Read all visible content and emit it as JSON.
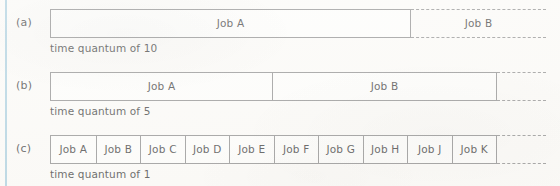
{
  "figure": {
    "kind": "gantt-timeline-round-robin",
    "left_rule_color": "#a9cede",
    "line_color": "#8c8c8c",
    "background_color": "#fbfaf7",
    "rows": [
      {
        "label": "(a)",
        "caption": "time quantum of 10",
        "segments": [
          {
            "name": "Job A",
            "style": "solid"
          }
        ],
        "tail": {
          "name": "Job B",
          "style": "dashed"
        }
      },
      {
        "label": "(b)",
        "caption": "time quantum of 5",
        "segments": [
          {
            "name": "Job A",
            "style": "solid"
          },
          {
            "name": "Job B",
            "style": "solid"
          }
        ],
        "tail": {
          "name": "",
          "style": "dashed"
        }
      },
      {
        "label": "(c)",
        "caption": "time quantum of 1",
        "segments": [
          {
            "name": "Job A",
            "style": "solid"
          },
          {
            "name": "Job B",
            "style": "solid"
          },
          {
            "name": "Job C",
            "style": "solid"
          },
          {
            "name": "Job D",
            "style": "solid"
          },
          {
            "name": "Job E",
            "style": "solid"
          },
          {
            "name": "Job F",
            "style": "solid"
          },
          {
            "name": "Job G",
            "style": "solid"
          },
          {
            "name": "Job H",
            "style": "solid"
          },
          {
            "name": "Job J",
            "style": "solid"
          },
          {
            "name": "Job K",
            "style": "solid"
          }
        ],
        "tail": {
          "name": "",
          "style": "dashed"
        }
      }
    ]
  }
}
